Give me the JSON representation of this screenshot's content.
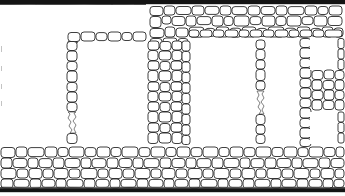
{
  "document": {
    "kind": "archaeological-site-plan",
    "title": "Stone masonry wall plan",
    "description": "Measured plan drawing of rubble-stone masonry walls enclosing a series of rectangular rooms",
    "width": 345,
    "height": 196,
    "background_color": "#ffffff",
    "ink_color": "#1d1d1d",
    "secondary_ink_color": "#4a4a4a",
    "band_color": "#141414"
  },
  "legend": {
    "stone_fill": "#ffffff",
    "stone_outline": "#1d1d1d",
    "room_fill": "#ffffff",
    "wall_hatch": "irregular-rubble-stones"
  },
  "layout": {
    "top_band": {
      "x": 0,
      "y": 0,
      "width": 345,
      "height": 4,
      "color": "#141414"
    },
    "bottom_band": {
      "x": 0,
      "y": 190,
      "width": 345,
      "height": 5,
      "color": "#141414"
    },
    "left_open_area": {
      "x": 0,
      "y": 5,
      "width": 150,
      "height": 142
    },
    "masonry_field": {
      "x": 148,
      "y": 4,
      "width": 197,
      "height": 186
    },
    "bottom_wall_band": {
      "x": 0,
      "y": 146,
      "width": 345,
      "height": 44
    }
  },
  "rooms": [
    {
      "id": "room-upper-left",
      "label": "Open area (upper left)",
      "x": 0,
      "y": 5,
      "width": 150,
      "height": 27,
      "enclosed": false
    },
    {
      "id": "room-1",
      "label": "Room 1",
      "x": 78,
      "y": 42,
      "width": 68,
      "height": 101,
      "enclosed": true
    },
    {
      "id": "room-2",
      "label": "Room 2",
      "x": 190,
      "y": 38,
      "width": 65,
      "height": 105,
      "enclosed": true
    },
    {
      "id": "room-3",
      "label": "Room 3",
      "x": 266,
      "y": 38,
      "width": 34,
      "height": 105,
      "enclosed": true
    },
    {
      "id": "room-4",
      "label": "Room 4 (north cell)",
      "x": 310,
      "y": 38,
      "width": 32,
      "height": 32,
      "enclosed": true
    },
    {
      "id": "room-5",
      "label": "Room 5 (south cell)",
      "x": 310,
      "y": 112,
      "width": 32,
      "height": 32,
      "enclosed": true
    }
  ],
  "walls": [
    {
      "id": "wall-north",
      "orientation": "horizontal",
      "label": "North wall"
    },
    {
      "id": "wall-south",
      "orientation": "horizontal",
      "label": "South wall"
    },
    {
      "id": "wall-room1-n",
      "orientation": "horizontal",
      "label": "Room 1 north wall"
    },
    {
      "id": "wall-room1-w",
      "orientation": "vertical",
      "label": "Room 1 west wall"
    },
    {
      "id": "wall-spine",
      "orientation": "vertical",
      "label": "Central spine wall"
    },
    {
      "id": "wall-partition-a",
      "orientation": "vertical",
      "label": "Partition between Room 2 and Room 3"
    },
    {
      "id": "wall-partition-b",
      "orientation": "vertical",
      "label": "Partition east of Room 3"
    },
    {
      "id": "wall-east",
      "orientation": "vertical",
      "label": "East wall"
    }
  ],
  "annotations": []
}
